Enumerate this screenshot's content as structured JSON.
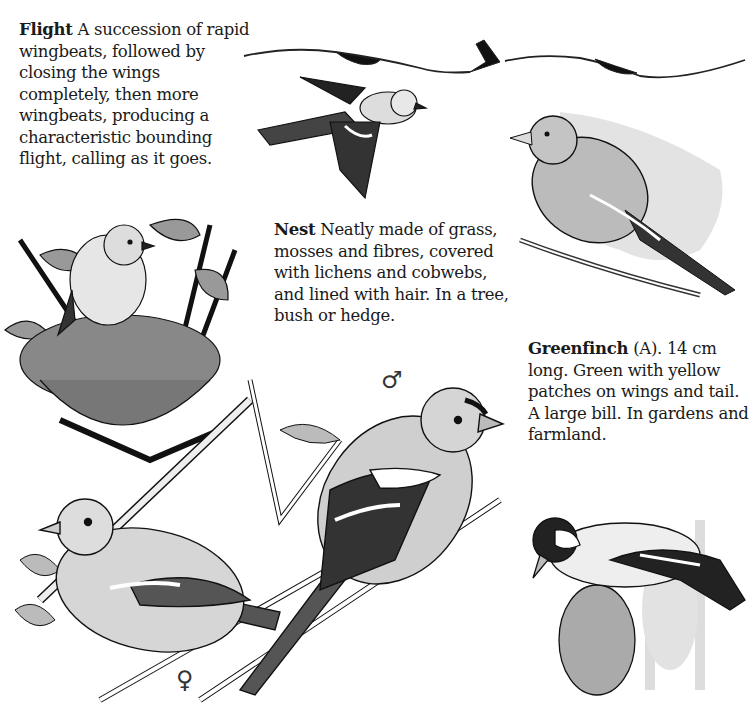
{
  "page": {
    "type": "field-guide-page"
  },
  "flight": {
    "heading": "Flight",
    "body": "A succession of rapid wingbeats, followed by closing the wings completely, then more wingbeats, producing a characteristic bounding flight, calling as it goes."
  },
  "nest": {
    "heading": "Nest",
    "body": "Neatly made of grass, mosses and fibres, covered with lichens and cobwebs, and lined with hair. In a tree, bush or hedge."
  },
  "greenfinch": {
    "heading": "Greenfinch",
    "body": "(A). 14 cm long. Green with yellow patches on wings and tail. A large bill. In gardens and farmland."
  },
  "symbols": {
    "male": "♂",
    "female": "♀"
  },
  "illustrations": [
    {
      "id": "flight-path",
      "description": "Bounding flight path with bird silhouettes"
    },
    {
      "id": "flying-chaffinch",
      "description": "Chaffinch in flight"
    },
    {
      "id": "nest-with-bird",
      "description": "Chaffinch perched on nest among leaves"
    },
    {
      "id": "greenfinch",
      "description": "Greenfinch perched on twig"
    },
    {
      "id": "male-chaffinch",
      "description": "Male chaffinch perched on branch"
    },
    {
      "id": "female-chaffinch",
      "description": "Female chaffinch perched on branch"
    },
    {
      "id": "goldfinch",
      "description": "Goldfinch on teasel head"
    }
  ],
  "colors": {
    "ink": "#1a1a1a",
    "paper": "#ffffff",
    "wash": "#d8d8d8"
  }
}
